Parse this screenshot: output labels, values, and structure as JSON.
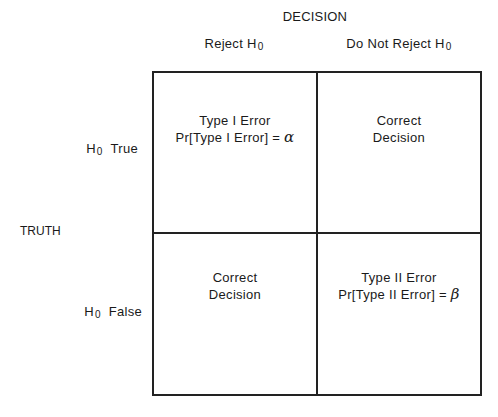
{
  "diagram": {
    "type": "2x2 decision table",
    "column_axis_title": "DECISION",
    "row_axis_title": "TRUTH",
    "columns": [
      {
        "label": "Reject H",
        "subscript": "0"
      },
      {
        "label": "Do Not Reject H",
        "subscript": "0"
      }
    ],
    "rows": [
      {
        "label_prefix": "H",
        "subscript": "0",
        "label_suffix": "True"
      },
      {
        "label_prefix": "H",
        "subscript": "0",
        "label_suffix": "False"
      }
    ],
    "cells": [
      [
        {
          "line1": "Type I Error",
          "line2_text": "Pr[Type I Error] = ",
          "line2_symbol": "α"
        },
        {
          "line1": "Correct",
          "line2_text": "Decision",
          "line2_symbol": ""
        }
      ],
      [
        {
          "line1": "Correct",
          "line2_text": "Decision",
          "line2_symbol": ""
        },
        {
          "line1": "Type II Error",
          "line2_text": "Pr[Type II Error] = ",
          "line2_symbol": "β"
        }
      ]
    ],
    "colors": {
      "line": "#222222",
      "text": "#1a1a1a",
      "background": "#ffffff"
    }
  }
}
